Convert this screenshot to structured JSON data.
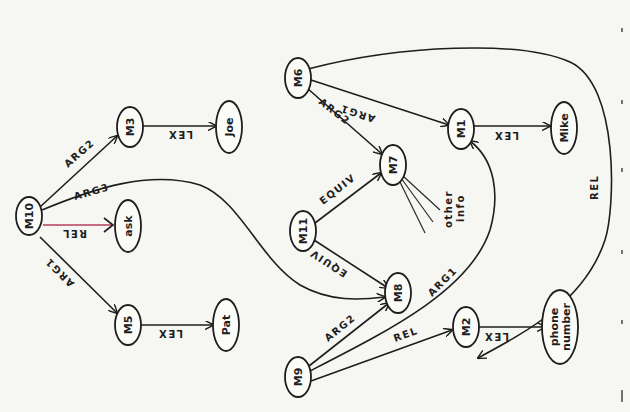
{
  "diagram": {
    "orientation": "rotated 90 degrees clockwise",
    "nodes": {
      "M10": "M10",
      "M3": "M3",
      "Joe": "Joe",
      "ask": "ask",
      "M5": "M5",
      "Pat": "Pat",
      "M6": "M6",
      "M7": "M7",
      "M1": "M1",
      "Mike": "Mike",
      "M11": "M11",
      "M8": "M8",
      "M9": "M9",
      "M2": "M2",
      "phone_line1": "phone",
      "phone_line2": "number",
      "other_line1": "other",
      "other_line2": "info"
    },
    "edges": {
      "m10_m3": "ARG2",
      "m10_m8": "ARG3",
      "m10_ask": "REL",
      "m10_m5": "ARG1",
      "m3_joe": "LEX",
      "m5_pat": "LEX",
      "m6_m1": "ARG1",
      "m6_m7": "ARG2",
      "m6_m2": "REL",
      "m1_mike": "LEX",
      "m11_m7": "EQUIV",
      "m11_m8": "EQUIV",
      "m9_m8": "ARG2",
      "m9_m1": "ARG1",
      "m9_m2": "REL",
      "m2_phone": "LEX"
    },
    "colors": {
      "ink": "#1e1e1e",
      "rel_highlight": "#b5405c",
      "paper": "#f6f6f3"
    }
  }
}
